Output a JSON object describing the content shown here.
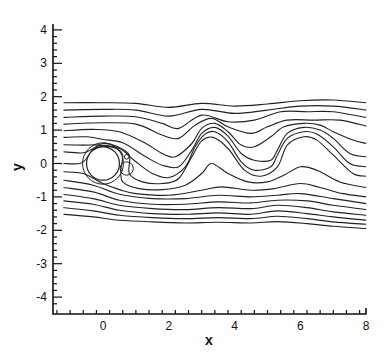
{
  "chart_data": {
    "type": "line",
    "title": "",
    "xlabel": "x",
    "ylabel": "y",
    "xlim": [
      -1.5,
      8
    ],
    "ylim": [
      -4.4,
      4.3
    ],
    "grid": false,
    "legend": null,
    "x_ticks": [
      0,
      2,
      4,
      6,
      8
    ],
    "x_tick_labels": [
      "0",
      "2",
      "4",
      "6",
      "8"
    ],
    "y_ticks": [
      -4,
      -3,
      -2,
      -1,
      0,
      1,
      2,
      3,
      4
    ],
    "y_tick_labels": [
      "-4",
      "-3",
      "-2",
      "-1",
      "0",
      "1",
      "2",
      "3",
      "4"
    ],
    "cylinder": {
      "cx": 0,
      "cy": 0,
      "r": 0.5
    },
    "eddies": [
      {
        "cx": 0.72,
        "cy": 0.2,
        "rx": 0.07,
        "ry": 0.07
      },
      {
        "cx": 0.72,
        "cy": -0.15,
        "rx": 0.2,
        "ry": 0.2
      }
    ],
    "series": [
      {
        "name": "s1",
        "points": [
          [
            -1.2,
            1.82
          ],
          [
            0,
            1.82
          ],
          [
            1,
            1.8
          ],
          [
            2,
            1.68
          ],
          [
            3,
            1.8
          ],
          [
            4,
            1.72
          ],
          [
            5,
            1.78
          ],
          [
            6,
            1.88
          ],
          [
            7,
            1.9
          ],
          [
            8,
            1.82
          ]
        ]
      },
      {
        "name": "s2",
        "points": [
          [
            -1.2,
            1.6
          ],
          [
            0,
            1.62
          ],
          [
            1,
            1.6
          ],
          [
            2,
            1.42
          ],
          [
            3,
            1.62
          ],
          [
            4,
            1.5
          ],
          [
            5,
            1.6
          ],
          [
            6,
            1.72
          ],
          [
            7,
            1.72
          ],
          [
            8,
            1.6
          ]
        ]
      },
      {
        "name": "s3",
        "points": [
          [
            -1.2,
            1.38
          ],
          [
            0,
            1.42
          ],
          [
            1,
            1.4
          ],
          [
            1.8,
            1.2
          ],
          [
            2.3,
            1.05
          ],
          [
            3,
            1.45
          ],
          [
            3.8,
            1.25
          ],
          [
            4.6,
            1.3
          ],
          [
            5.4,
            1.55
          ],
          [
            6.2,
            1.55
          ],
          [
            7,
            1.55
          ],
          [
            8,
            1.38
          ]
        ]
      },
      {
        "name": "s4",
        "points": [
          [
            -1.2,
            1.18
          ],
          [
            0,
            1.22
          ],
          [
            1,
            1.18
          ],
          [
            1.8,
            0.85
          ],
          [
            2.3,
            0.75
          ],
          [
            2.8,
            1.15
          ],
          [
            3.3,
            1.35
          ],
          [
            3.8,
            1.1
          ],
          [
            4.5,
            0.9
          ],
          [
            5,
            1.1
          ],
          [
            5.6,
            1.3
          ],
          [
            6.4,
            1.3
          ],
          [
            7.2,
            1.3
          ],
          [
            8,
            1.12
          ]
        ]
      },
      {
        "name": "s5",
        "points": [
          [
            -1.2,
            0.98
          ],
          [
            -0.3,
            1.02
          ],
          [
            0.5,
            0.95
          ],
          [
            1.3,
            0.6
          ],
          [
            1.8,
            0.3
          ],
          [
            2.2,
            0.2
          ],
          [
            2.7,
            0.6
          ],
          [
            3.0,
            1.05
          ],
          [
            3.4,
            1.2
          ],
          [
            3.8,
            0.95
          ],
          [
            4.2,
            0.55
          ],
          [
            4.6,
            0.5
          ],
          [
            5.1,
            0.8
          ],
          [
            5.5,
            1.1
          ],
          [
            6.1,
            1.2
          ],
          [
            6.6,
            1.15
          ],
          [
            7.0,
            0.95
          ],
          [
            7.6,
            0.7
          ],
          [
            8,
            0.6
          ]
        ]
      },
      {
        "name": "s6",
        "points": [
          [
            -1.2,
            0.78
          ],
          [
            -0.5,
            0.8
          ],
          [
            0,
            0.72
          ],
          [
            0.6,
            0.62
          ],
          [
            1.3,
            0.2
          ],
          [
            1.8,
            -0.05
          ],
          [
            2.3,
            -0.1
          ],
          [
            2.7,
            0.4
          ],
          [
            3.0,
            0.9
          ],
          [
            3.4,
            1.08
          ],
          [
            3.8,
            0.82
          ],
          [
            4.2,
            0.3
          ],
          [
            4.6,
            0.1
          ],
          [
            5.1,
            0.1
          ],
          [
            5.3,
            0.4
          ],
          [
            5.6,
            0.9
          ],
          [
            6.1,
            1.08
          ],
          [
            6.6,
            1.0
          ],
          [
            7.0,
            0.75
          ],
          [
            7.5,
            0.3
          ],
          [
            8,
            0.2
          ]
        ]
      },
      {
        "name": "s7",
        "points": [
          [
            -1.2,
            0.56
          ],
          [
            -0.6,
            0.55
          ],
          [
            -0.1,
            0.55
          ],
          [
            0.5,
            0.45
          ],
          [
            1.0,
            0.05
          ],
          [
            1.5,
            -0.3
          ],
          [
            2.0,
            -0.42
          ],
          [
            2.5,
            -0.1
          ],
          [
            2.8,
            0.5
          ],
          [
            3.1,
            0.88
          ],
          [
            3.4,
            0.95
          ],
          [
            3.8,
            0.65
          ],
          [
            4.2,
            0.05
          ],
          [
            4.6,
            -0.2
          ],
          [
            5.1,
            -0.1
          ],
          [
            5.3,
            0.25
          ],
          [
            5.6,
            0.75
          ],
          [
            6.1,
            0.95
          ],
          [
            6.5,
            0.88
          ],
          [
            7.0,
            0.5
          ],
          [
            7.5,
            0.0
          ],
          [
            8,
            -0.1
          ]
        ]
      },
      {
        "name": "s8",
        "points": [
          [
            -1.2,
            0.35
          ],
          [
            -0.6,
            0.32
          ],
          [
            -0.3,
            0.45
          ],
          [
            0,
            0.6
          ],
          [
            0.4,
            0.52
          ],
          [
            0.8,
            0.25
          ],
          [
            0.8,
            -0.3
          ],
          [
            1.2,
            -0.55
          ],
          [
            1.8,
            -0.6
          ],
          [
            2.3,
            -0.45
          ],
          [
            2.7,
            0.2
          ],
          [
            3.0,
            0.68
          ],
          [
            3.35,
            0.78
          ],
          [
            3.8,
            0.45
          ],
          [
            4.3,
            -0.2
          ],
          [
            4.8,
            -0.38
          ],
          [
            5.3,
            -0.1
          ],
          [
            5.6,
            0.55
          ],
          [
            6.1,
            0.8
          ],
          [
            6.5,
            0.7
          ],
          [
            7.0,
            0.25
          ],
          [
            7.6,
            -0.3
          ],
          [
            8,
            -0.38
          ]
        ]
      },
      {
        "name": "s9",
        "points": [
          [
            -1.2,
            0.0
          ],
          [
            -0.7,
            0.0
          ],
          [
            -0.5,
            0.15
          ],
          [
            -0.3,
            0.42
          ],
          [
            0,
            0.52
          ],
          [
            0.4,
            0.45
          ],
          [
            0.6,
            0.25
          ],
          [
            0.55,
            -0.15
          ],
          [
            0.6,
            -0.55
          ],
          [
            1.1,
            -0.75
          ],
          [
            1.8,
            -0.78
          ],
          [
            2.5,
            -0.65
          ],
          [
            3.0,
            -0.3
          ],
          [
            3.3,
            0.0
          ],
          [
            3.8,
            -0.3
          ],
          [
            4.4,
            -0.55
          ],
          [
            5.0,
            -0.55
          ],
          [
            5.5,
            -0.35
          ],
          [
            6.0,
            -0.1
          ],
          [
            6.5,
            -0.2
          ],
          [
            7.2,
            -0.55
          ],
          [
            8,
            -0.72
          ]
        ]
      },
      {
        "name": "s10",
        "points": [
          [
            -1.2,
            -0.25
          ],
          [
            -0.6,
            -0.3
          ],
          [
            0,
            -0.6
          ],
          [
            0.5,
            -0.78
          ],
          [
            1.0,
            -0.9
          ],
          [
            2.0,
            -0.95
          ],
          [
            3.0,
            -0.8
          ],
          [
            3.6,
            -0.7
          ],
          [
            4.5,
            -0.8
          ],
          [
            5.2,
            -0.75
          ],
          [
            6.0,
            -0.6
          ],
          [
            6.6,
            -0.72
          ],
          [
            7.3,
            -0.9
          ],
          [
            8,
            -1.0
          ]
        ]
      },
      {
        "name": "s11",
        "points": [
          [
            -1.2,
            -0.5
          ],
          [
            -0.3,
            -0.65
          ],
          [
            0.5,
            -0.92
          ],
          [
            1.5,
            -1.05
          ],
          [
            2.5,
            -1.05
          ],
          [
            3.5,
            -0.95
          ],
          [
            4.5,
            -1.0
          ],
          [
            5.3,
            -0.95
          ],
          [
            6.0,
            -0.9
          ],
          [
            7.0,
            -1.05
          ],
          [
            8,
            -1.2
          ]
        ]
      },
      {
        "name": "s12",
        "points": [
          [
            -1.2,
            -0.72
          ],
          [
            -0.3,
            -0.85
          ],
          [
            0.5,
            -1.1
          ],
          [
            1.5,
            -1.22
          ],
          [
            2.5,
            -1.22
          ],
          [
            3.5,
            -1.15
          ],
          [
            4.5,
            -1.18
          ],
          [
            5.3,
            -1.1
          ],
          [
            6.2,
            -1.12
          ],
          [
            7.0,
            -1.25
          ],
          [
            8,
            -1.38
          ]
        ]
      },
      {
        "name": "s13",
        "points": [
          [
            -1.2,
            -0.92
          ],
          [
            -0.3,
            -1.05
          ],
          [
            0.5,
            -1.25
          ],
          [
            1.5,
            -1.35
          ],
          [
            2.5,
            -1.38
          ],
          [
            3.5,
            -1.32
          ],
          [
            4.5,
            -1.35
          ],
          [
            5.3,
            -1.25
          ],
          [
            6.2,
            -1.32
          ],
          [
            7.0,
            -1.45
          ],
          [
            8,
            -1.55
          ]
        ]
      },
      {
        "name": "s14",
        "points": [
          [
            -1.2,
            -1.12
          ],
          [
            -0.3,
            -1.22
          ],
          [
            0.5,
            -1.4
          ],
          [
            1.5,
            -1.5
          ],
          [
            2.5,
            -1.52
          ],
          [
            3.5,
            -1.48
          ],
          [
            4.5,
            -1.52
          ],
          [
            5.3,
            -1.42
          ],
          [
            6.2,
            -1.5
          ],
          [
            7.0,
            -1.6
          ],
          [
            8,
            -1.7
          ]
        ]
      },
      {
        "name": "s15",
        "points": [
          [
            -1.2,
            -1.32
          ],
          [
            -0.3,
            -1.42
          ],
          [
            0.5,
            -1.55
          ],
          [
            1.5,
            -1.62
          ],
          [
            2.5,
            -1.65
          ],
          [
            3.5,
            -1.62
          ],
          [
            4.5,
            -1.65
          ],
          [
            5.3,
            -1.58
          ],
          [
            6.2,
            -1.65
          ],
          [
            7.0,
            -1.75
          ],
          [
            8,
            -1.82
          ]
        ]
      },
      {
        "name": "s16",
        "points": [
          [
            -1.2,
            -1.52
          ],
          [
            -0.3,
            -1.6
          ],
          [
            0.5,
            -1.7
          ],
          [
            1.5,
            -1.75
          ],
          [
            2.5,
            -1.78
          ],
          [
            3.5,
            -1.76
          ],
          [
            4.5,
            -1.78
          ],
          [
            5.3,
            -1.74
          ],
          [
            6.2,
            -1.8
          ],
          [
            7.0,
            -1.88
          ],
          [
            8,
            -1.95
          ]
        ]
      }
    ]
  }
}
